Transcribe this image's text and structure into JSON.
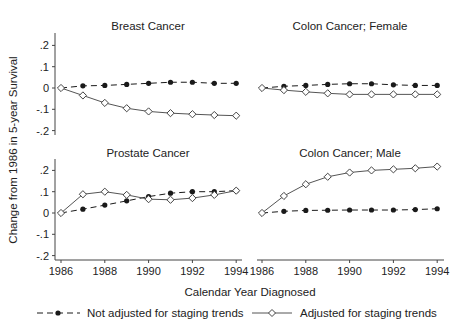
{
  "chart_data": {
    "type": "line",
    "title": "",
    "xlabel": "Calendar Year Diagnosed",
    "ylabel": "Change from 1986 in 5-year Survival",
    "x": [
      1986,
      1987,
      1988,
      1989,
      1990,
      1991,
      1992,
      1993,
      1994
    ],
    "xticks": [
      1986,
      1988,
      1990,
      1992,
      1994
    ],
    "yticks": [
      0.2,
      0.1,
      0,
      -0.1,
      -0.2
    ],
    "ytick_labels": [
      ".2",
      ".1",
      "0",
      "-.1",
      "-.2"
    ],
    "ylim": [
      -0.2,
      0.2
    ],
    "grid": false,
    "legend_position": "bottom",
    "legend": [
      {
        "name": "Not adjusted for staging trends",
        "style": "dashed",
        "marker": "filled-circle"
      },
      {
        "name": "Adjusted for staging trends",
        "style": "solid",
        "marker": "hollow-diamond"
      }
    ],
    "panels": [
      {
        "title": "Breast Cancer",
        "series": [
          {
            "name": "Not adjusted for staging trends",
            "values": [
              0,
              0.01,
              0.012,
              0.017,
              0.022,
              0.027,
              0.027,
              0.022,
              0.022
            ]
          },
          {
            "name": "Adjusted for staging trends",
            "values": [
              0,
              -0.035,
              -0.07,
              -0.095,
              -0.11,
              -0.118,
              -0.123,
              -0.127,
              -0.13
            ]
          }
        ]
      },
      {
        "title": "Colon Cancer; Female",
        "series": [
          {
            "name": "Not adjusted for staging trends",
            "values": [
              0,
              0.008,
              0.012,
              0.017,
              0.02,
              0.02,
              0.015,
              0.012,
              0.012
            ]
          },
          {
            "name": "Adjusted for staging trends",
            "values": [
              0,
              -0.01,
              -0.018,
              -0.025,
              -0.03,
              -0.03,
              -0.03,
              -0.03,
              -0.03
            ]
          }
        ]
      },
      {
        "title": "Prostate Cancer",
        "series": [
          {
            "name": "Not adjusted for staging trends",
            "values": [
              0,
              0.018,
              0.037,
              0.057,
              0.077,
              0.093,
              0.1,
              0.1,
              0.105
            ]
          },
          {
            "name": "Adjusted for staging trends",
            "values": [
              0,
              0.088,
              0.1,
              0.085,
              0.065,
              0.062,
              0.07,
              0.085,
              0.105
            ]
          }
        ]
      },
      {
        "title": "Colon Cancer; Male",
        "series": [
          {
            "name": "Not adjusted for staging trends",
            "values": [
              0,
              0.008,
              0.012,
              0.013,
              0.014,
              0.014,
              0.014,
              0.016,
              0.02
            ]
          },
          {
            "name": "Adjusted for staging trends",
            "values": [
              0,
              0.08,
              0.135,
              0.17,
              0.19,
              0.2,
              0.205,
              0.21,
              0.218
            ]
          }
        ]
      }
    ]
  },
  "colors": {
    "text": "#222222",
    "axis": "#444444",
    "unadjusted": "#1a1a1a",
    "adjusted": "#555555",
    "background": "#ffffff"
  }
}
